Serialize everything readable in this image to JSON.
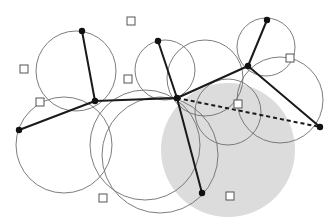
{
  "diagram": {
    "colors": {
      "background": "#ffffff",
      "disk": "#dcdcdc",
      "circle_stroke": "#6e6e6e",
      "edge": "#1a1a1a",
      "node": "#111111",
      "square_stroke": "#555555"
    },
    "disk": {
      "cx": 228,
      "cy": 150,
      "r": 67
    },
    "circles": [
      {
        "cx": 76,
        "cy": 71,
        "r": 40
      },
      {
        "cx": 64,
        "cy": 145,
        "r": 48
      },
      {
        "cx": 145,
        "cy": 145,
        "r": 55
      },
      {
        "cx": 160,
        "cy": 155,
        "r": 58
      },
      {
        "cx": 165,
        "cy": 70,
        "r": 30
      },
      {
        "cx": 205,
        "cy": 78,
        "r": 38
      },
      {
        "cx": 266,
        "cy": 47,
        "r": 29
      },
      {
        "cx": 280,
        "cy": 100,
        "r": 43
      },
      {
        "cx": 228,
        "cy": 112,
        "r": 33
      }
    ],
    "nodes": [
      {
        "id": "n1",
        "x": 82,
        "y": 31
      },
      {
        "id": "n2",
        "x": 158,
        "y": 41
      },
      {
        "id": "n3",
        "x": 95,
        "y": 101
      },
      {
        "id": "n4",
        "x": 19,
        "y": 130
      },
      {
        "id": "n5",
        "x": 177,
        "y": 98
      },
      {
        "id": "n6",
        "x": 267,
        "y": 20
      },
      {
        "id": "n7",
        "x": 248,
        "y": 66
      },
      {
        "id": "n8",
        "x": 320,
        "y": 127
      },
      {
        "id": "n9",
        "x": 202,
        "y": 193
      }
    ],
    "edges": [
      {
        "from": "n1",
        "to": "n3",
        "style": "solid"
      },
      {
        "from": "n4",
        "to": "n3",
        "style": "solid"
      },
      {
        "from": "n3",
        "to": "n5",
        "style": "solid"
      },
      {
        "from": "n2",
        "to": "n5",
        "style": "solid"
      },
      {
        "from": "n5",
        "to": "n7",
        "style": "solid"
      },
      {
        "from": "n6",
        "to": "n7",
        "style": "solid"
      },
      {
        "from": "n7",
        "to": "n8",
        "style": "solid"
      },
      {
        "from": "n5",
        "to": "n9",
        "style": "solid"
      },
      {
        "from": "n5",
        "to": "n8",
        "style": "dashed"
      }
    ],
    "squares": [
      {
        "x": 131,
        "y": 21
      },
      {
        "x": 24,
        "y": 69
      },
      {
        "x": 128,
        "y": 79
      },
      {
        "x": 40,
        "y": 102
      },
      {
        "x": 238,
        "y": 104
      },
      {
        "x": 290,
        "y": 58
      },
      {
        "x": 103,
        "y": 198
      },
      {
        "x": 230,
        "y": 196
      }
    ],
    "square_size": 8
  }
}
